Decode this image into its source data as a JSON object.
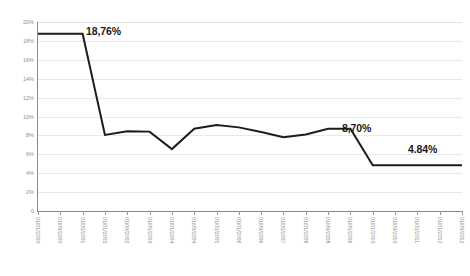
{
  "chart_data": {
    "type": "line",
    "title": "",
    "xlabel": "",
    "ylabel": "",
    "ylim": [
      0,
      20
    ],
    "yticks": [
      "0",
      "2%",
      "4%",
      "6%",
      "8%",
      "10%",
      "12%",
      "14%",
      "16%",
      "18%",
      "20%"
    ],
    "grid": true,
    "legend": "none",
    "line_color": "#1c1c1c",
    "gridline_color": "#e9e9e9",
    "axis_color": "#8a8a8a",
    "tick_label_color": "#8d8d8d",
    "annotation_color": "#1a1a1a",
    "categories": [
      "01/01/2000",
      "01/09/2000",
      "01/05/2001",
      "01/01/2002",
      "01/09/2002",
      "01/05/2003",
      "01/01/2004",
      "01/09/2004",
      "01/05/2005",
      "01/01/2006",
      "01/09/2006",
      "01/05/2007",
      "01/01/2008",
      "01/09/2008",
      "01/05/2009",
      "01/01/2010",
      "01/09/2010",
      "01/05/2011",
      "01/01/2012",
      "01/09/2012"
    ],
    "values": [
      18.76,
      18.76,
      18.76,
      8.05,
      8.45,
      8.4,
      6.55,
      8.7,
      9.1,
      8.85,
      8.35,
      7.8,
      8.1,
      8.7,
      8.7,
      4.84,
      4.84,
      4.84,
      4.84,
      4.84
    ],
    "annotations": [
      {
        "text": "18,76%",
        "value": 18.76,
        "x_px": 86,
        "y_px": 25
      },
      {
        "text": "8,70%",
        "value": 8.7,
        "x_px": 342,
        "y_px": 122
      },
      {
        "text": "4.84%",
        "value": 4.84,
        "x_px": 408,
        "y_px": 143
      }
    ]
  }
}
